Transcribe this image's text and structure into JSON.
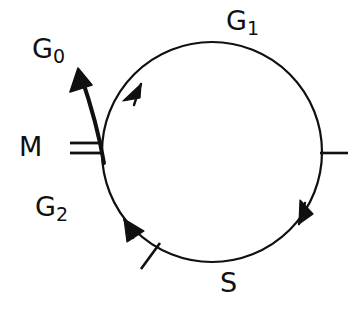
{
  "diagram": {
    "background_color": "#ffffff",
    "stroke_color": "#101010",
    "labels": {
      "g0": {
        "base": "G",
        "sub": "0",
        "full": "G0"
      },
      "m": {
        "base": "M",
        "sub": "",
        "full": "M"
      },
      "g2": {
        "base": "G",
        "sub": "2",
        "full": "G2"
      },
      "g1": {
        "base": "G",
        "sub": "1",
        "full": "G1"
      },
      "s": {
        "base": "S",
        "sub": "",
        "full": "S"
      }
    },
    "cycle": {
      "center_x": 212,
      "center_y": 152,
      "radius": 110,
      "direction": "clockwise",
      "stroke_width": 2.2
    },
    "arrowheads": [
      {
        "name": "g1-arrowhead",
        "x": 141,
        "y": 86,
        "angle_deg": 44
      },
      {
        "name": "s-arrowhead",
        "x": 307,
        "y": 215,
        "angle_deg": 226
      },
      {
        "name": "g2-arrowhead",
        "x": 128,
        "y": 223,
        "angle_deg": 43
      }
    ],
    "ticks": [
      {
        "name": "m-tick-upper",
        "x1": 70,
        "y1": 143,
        "x2": 101,
        "y2": 143
      },
      {
        "name": "m-tick-lower",
        "x1": 70,
        "y1": 153,
        "x2": 102,
        "y2": 153
      },
      {
        "name": "right-tick",
        "x1": 320,
        "y1": 153,
        "x2": 348,
        "y2": 153
      },
      {
        "name": "lower-left-tick",
        "x1": 141,
        "y1": 269,
        "x2": 160,
        "y2": 243
      }
    ],
    "g0_branch": {
      "name": "g0-exit-arrow",
      "start_x": 104,
      "start_y": 160,
      "tip_x": 78,
      "tip_y": 70,
      "stroke_width": 4.0
    }
  }
}
